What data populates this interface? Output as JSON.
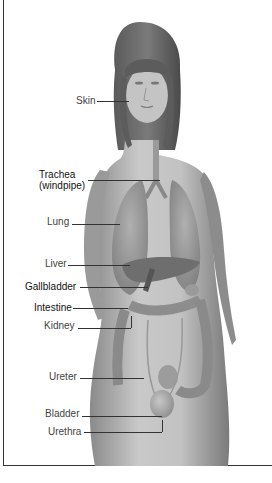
{
  "diagram": {
    "labels": [
      {
        "id": "skin",
        "text": "Skin"
      },
      {
        "id": "trachea",
        "text": "Trachea"
      },
      {
        "id": "trachea_sub",
        "text": "(windpipe)"
      },
      {
        "id": "lung",
        "text": "Lung"
      },
      {
        "id": "liver",
        "text": "Liver"
      },
      {
        "id": "gallbladder",
        "text": "Gallbladder"
      },
      {
        "id": "intestine",
        "text": "Intestine"
      },
      {
        "id": "kidney",
        "text": "Kidney"
      },
      {
        "id": "ureter",
        "text": "Ureter"
      },
      {
        "id": "bladder",
        "text": "Bladder"
      },
      {
        "id": "urethra",
        "text": "Urethra"
      }
    ]
  },
  "colors": {
    "background": "#ffffff",
    "frame": "#333333",
    "label_text": "#444444",
    "leader_line": "#333333",
    "skin_tone": "#b5b5b5",
    "hair": "#555555",
    "organ_dark": "#6e6e6e",
    "organ_mid": "#8f8f8f"
  }
}
